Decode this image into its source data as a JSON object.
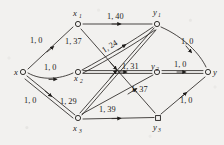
{
  "figure": {
    "type": "network-flow-digraph",
    "background_color": "#f2f1ef",
    "ink_color": "#1e1c1a"
  },
  "nodes": [
    {
      "id": "x",
      "label": "x",
      "sub": "",
      "cx": 23,
      "cy": 72,
      "shape": "circle"
    },
    {
      "id": "x1",
      "label": "x",
      "sub": "1",
      "cx": 78,
      "cy": 24,
      "shape": "circle"
    },
    {
      "id": "x2",
      "label": "x",
      "sub": "2",
      "cx": 78,
      "cy": 72,
      "shape": "circle"
    },
    {
      "id": "x3",
      "label": "x",
      "sub": "3",
      "cx": 78,
      "cy": 118,
      "shape": "circle"
    },
    {
      "id": "y1",
      "label": "y",
      "sub": "1",
      "cx": 157,
      "cy": 24,
      "shape": "circle"
    },
    {
      "id": "y2",
      "label": "y",
      "sub": "2",
      "cx": 157,
      "cy": 72,
      "shape": "circle"
    },
    {
      "id": "y3",
      "label": "y",
      "sub": "3",
      "cx": 158,
      "cy": 118,
      "shape": "square"
    },
    {
      "id": "y",
      "label": "y",
      "sub": "",
      "cx": 208,
      "cy": 72,
      "shape": "circle"
    }
  ],
  "edges": [
    {
      "id": "x-x1",
      "from": "x",
      "to": "x1",
      "capacity": 1,
      "cost": 0,
      "label": "1, 0",
      "bold": false
    },
    {
      "id": "x-x2",
      "from": "x",
      "to": "x2",
      "capacity": 1,
      "cost": 0,
      "label": "1, 0",
      "bold": false
    },
    {
      "id": "x-x3",
      "from": "x",
      "to": "x3",
      "capacity": 1,
      "cost": 0,
      "label": "1, 0",
      "bold": true
    },
    {
      "id": "x1-y1",
      "from": "x1",
      "to": "y1",
      "capacity": 1,
      "cost": 40,
      "label": "1, 40",
      "bold": false
    },
    {
      "id": "x1-y3",
      "from": "x1",
      "to": "y3",
      "capacity": 1,
      "cost": 37,
      "label": "1, 37",
      "bold": false
    },
    {
      "id": "x2-y1",
      "from": "x2",
      "to": "y1",
      "capacity": 1,
      "cost": 24,
      "label": "1, 24",
      "bold": true
    },
    {
      "id": "x2-y2",
      "from": "x2",
      "to": "y2",
      "capacity": 1,
      "cost": 31,
      "label": "1, 31",
      "bold": true
    },
    {
      "id": "x3-y1",
      "from": "x3",
      "to": "y1",
      "capacity": 1,
      "cost": 29,
      "label": "1, 29",
      "bold": true
    },
    {
      "id": "x3-y2",
      "from": "x3",
      "to": "y2",
      "capacity": 1,
      "cost": 37,
      "label": "1, 37",
      "bold": false
    },
    {
      "id": "x3-y3",
      "from": "x3",
      "to": "y3",
      "capacity": 1,
      "cost": 39,
      "label": "1, 39",
      "bold": false
    },
    {
      "id": "y1-y",
      "from": "y1",
      "to": "y",
      "capacity": 1,
      "cost": 0,
      "label": "1, 0",
      "bold": false
    },
    {
      "id": "y2-y",
      "from": "y2",
      "to": "y",
      "capacity": 1,
      "cost": 0,
      "label": "1, 0",
      "bold": true
    },
    {
      "id": "y3-y",
      "from": "y3",
      "to": "y",
      "capacity": 1,
      "cost": 0,
      "label": "1, 0",
      "bold": false
    }
  ],
  "edge_labels": {
    "x_x1": "1, 0",
    "x_x2": "1, 0",
    "x_x3": "1, 0",
    "x1_y1": "1, 40",
    "x1_y3": "1, 37",
    "x2_y1": "1, 24",
    "x2_y2": "1, 31",
    "x3_y1": "1, 29",
    "x3_y2": "1, 37",
    "x3_y3": "1, 39",
    "y1_y": "1, 0",
    "y2_y": "1, 0",
    "y3_y": "1, 0"
  },
  "node_labels": {
    "x": {
      "base": "x",
      "sub": ""
    },
    "x1": {
      "base": "x",
      "sub": "1"
    },
    "x2": {
      "base": "x",
      "sub": "2"
    },
    "x3": {
      "base": "x",
      "sub": "3"
    },
    "y1": {
      "base": "y",
      "sub": "1"
    },
    "y2": {
      "base": "y",
      "sub": "2"
    },
    "y3": {
      "base": "y",
      "sub": "3"
    },
    "y": {
      "base": "y",
      "sub": ""
    }
  }
}
